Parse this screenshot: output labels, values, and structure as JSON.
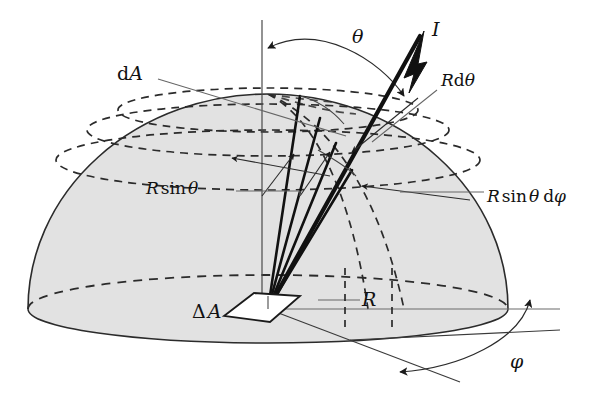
{
  "figure": {
    "background_color": "#ffffff",
    "ink_color": "#1a1a1a",
    "dome_fill_color": "#e2e2e2",
    "dome_edge_color": "#333333",
    "leader_color": "#555555",
    "width": 609,
    "height": 397
  },
  "labels": {
    "dA": "dA",
    "theta": "θ",
    "I": "I",
    "R_dtheta": "R dθ",
    "R_sin_theta": "R sin θ",
    "R_sin_theta_dphi": "R sin θ dφ",
    "delta_A": "ΔA",
    "R": "R",
    "phi": "φ"
  },
  "label_parts": {
    "dA": {
      "d": "d",
      "A": "A"
    },
    "R_dtheta": {
      "R": "R",
      "d": "d",
      "theta": "θ"
    },
    "R_sin_theta": {
      "R": "R",
      "sin": "sin",
      "theta": "θ"
    },
    "R_sin_theta_dphi": {
      "R": "R",
      "sin": "sin",
      "theta": "θ",
      "d": "d",
      "phi": "φ"
    },
    "delta_A": {
      "delta": "Δ",
      "A": "A"
    }
  },
  "geometry": {
    "origin": {
      "x": 268,
      "y": 309
    },
    "dome_center": {
      "x": 268,
      "y": 309
    },
    "dome_radius_x": 240,
    "dome_radius_y": 215,
    "base_ellipse_ry": 34,
    "polar_axis_top": {
      "x": 262,
      "y": 20
    },
    "intensity_arrow_tip": {
      "x": 424,
      "y": 31
    },
    "latitude_circles": 4,
    "theta_arc_degrees": 36,
    "phi_arc_degrees": 28
  },
  "annotations": [
    {
      "name": "dA",
      "text": "dA",
      "x": 117,
      "y": 72
    },
    {
      "name": "theta",
      "text": "θ",
      "x": 352,
      "y": 36
    },
    {
      "name": "I",
      "text": "I",
      "x": 432,
      "y": 27
    },
    {
      "name": "R-dtheta",
      "text": "R dθ",
      "x": 441,
      "y": 80
    },
    {
      "name": "R-sin-theta",
      "text": "R sin θ",
      "x": 162,
      "y": 188
    },
    {
      "name": "R-sin-theta-dphi",
      "text": "R sin θ dφ",
      "x": 487,
      "y": 196
    },
    {
      "name": "delta-A",
      "text": "ΔA",
      "x": 194,
      "y": 311
    },
    {
      "name": "R",
      "text": "R",
      "x": 364,
      "y": 298
    },
    {
      "name": "phi",
      "text": "φ",
      "x": 512,
      "y": 362
    }
  ]
}
